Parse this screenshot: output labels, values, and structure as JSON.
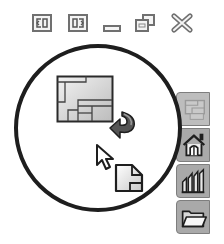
{
  "window_controls": {
    "buttons": [
      {
        "name": "tile-left",
        "icon": "tile-left-icon"
      },
      {
        "name": "tile-right",
        "icon": "tile-right-icon"
      },
      {
        "name": "minimize",
        "icon": "minimize-icon"
      },
      {
        "name": "restore",
        "icon": "restore-icon"
      },
      {
        "name": "close",
        "icon": "close-icon"
      }
    ]
  },
  "callout": {
    "description": "Drag layout thumbnail into document area",
    "items": [
      {
        "name": "floor-plan-layout",
        "icon": "floor-plan-icon"
      },
      {
        "name": "rotate-arrow",
        "icon": "curved-arrow-icon"
      },
      {
        "name": "cursor",
        "icon": "mouse-pointer-icon"
      },
      {
        "name": "new-document",
        "icon": "document-icon"
      }
    ]
  },
  "side_panel": {
    "tabs": [
      {
        "name": "layouts",
        "icon": "floor-plan-icon",
        "state": "faded"
      },
      {
        "name": "home",
        "icon": "house-icon"
      },
      {
        "name": "reports",
        "icon": "bar-chart-icon"
      },
      {
        "name": "files",
        "icon": "folder-icon"
      }
    ]
  },
  "colors": {
    "outline": "#1e1e1e",
    "tab_bg": "#a9a9a9",
    "tab_border": "#7e7e7e",
    "icon_gray": "#8a8a8a",
    "light_fill": "#e4e4e4"
  }
}
